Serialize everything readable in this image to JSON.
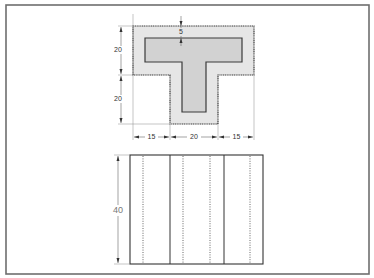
{
  "drawing": {
    "title": "T-section orthographic projection",
    "top_view": {
      "description": "T-shaped cross-section with inner hollow T",
      "dimensions": {
        "wall_thickness": "5",
        "flange_height": "20",
        "stem_height": "20",
        "left_overhang": "15",
        "stem_width": "20",
        "right_overhang": "15"
      }
    },
    "front_view": {
      "description": "Rectangular elevation with solid edges and hidden (dotted) lines",
      "dimensions": {
        "height": "40"
      },
      "solid_line_count": 2,
      "hidden_line_count": 4
    },
    "colors": {
      "outer_fill": "#e6e6e6",
      "inner_fill": "#d2d2d2",
      "outline": "#3a3a3a",
      "frame": "#6e6e6e"
    }
  }
}
